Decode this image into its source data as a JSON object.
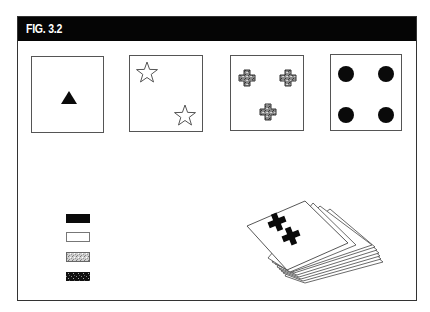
{
  "figure": {
    "title": "FIG. 3.2",
    "header_color": "#050505"
  },
  "cards": [
    {
      "name": "card-one-triangle",
      "symbol": "triangle",
      "count": 1,
      "fill": "solid-black"
    },
    {
      "name": "card-two-stars",
      "symbol": "star",
      "count": 2,
      "fill": "outline-white"
    },
    {
      "name": "card-three-crosses",
      "symbol": "cross",
      "count": 3,
      "fill": "gray-speckled"
    },
    {
      "name": "card-four-circles",
      "symbol": "circle",
      "count": 4,
      "fill": "solid-black"
    }
  ],
  "legend": {
    "swatches": [
      {
        "name": "solid-black",
        "color": "#0a0a0a"
      },
      {
        "name": "white-outline",
        "color": "#ffffff"
      },
      {
        "name": "gray-speckled",
        "color": "#bdbdbd"
      },
      {
        "name": "dark-speckled",
        "color": "#1a1a1a"
      }
    ]
  },
  "deck": {
    "top_card_symbol": "cross",
    "top_card_symbol_count": 2,
    "stacked_cards": 8
  }
}
